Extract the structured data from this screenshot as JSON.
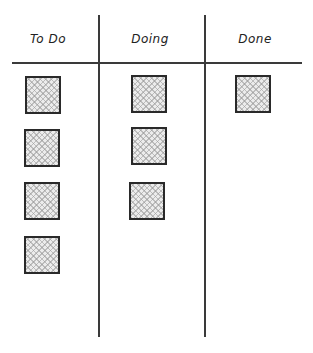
{
  "board": {
    "columns": [
      {
        "title": "To Do",
        "card_count": 4
      },
      {
        "title": "Doing",
        "card_count": 3
      },
      {
        "title": "Done",
        "card_count": 1
      }
    ]
  },
  "colors": {
    "line": "#3a3a3a",
    "card_border": "#2a2a2a",
    "card_fill": "#ececec",
    "background": "#ffffff"
  }
}
